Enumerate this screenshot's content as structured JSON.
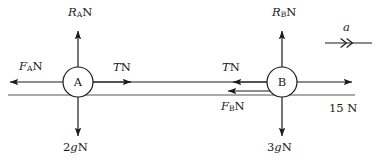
{
  "diagram": {
    "type": "free-body-force-diagram",
    "title": "",
    "bodies": [
      {
        "id": "A",
        "label": "A",
        "cx": 78,
        "cy": 82,
        "r": 15,
        "mass_weight_label": "2gN"
      },
      {
        "id": "B",
        "label": "B",
        "cx": 282,
        "cy": 82,
        "r": 15,
        "mass_weight_label": "3gN"
      }
    ],
    "ground_line": {
      "y": 95,
      "x1": 8,
      "x2": 355
    },
    "forces": [
      {
        "name": "normal-reaction-a",
        "label_text": "R",
        "label_sub": "A",
        "label_unit": "N",
        "direction": "up",
        "body": "A"
      },
      {
        "name": "normal-reaction-b",
        "label_text": "R",
        "label_sub": "B",
        "label_unit": "N",
        "direction": "up",
        "body": "B"
      },
      {
        "name": "friction-a",
        "label_text": "F",
        "label_sub": "A",
        "label_unit": "N",
        "direction": "left",
        "body": "A"
      },
      {
        "name": "friction-b",
        "label_text": "F",
        "label_sub": "B",
        "label_unit": "N",
        "direction": "left",
        "body": "B"
      },
      {
        "name": "tension-a",
        "label_text": "T",
        "label_sub": "",
        "label_unit": "N",
        "direction": "right",
        "body": "A"
      },
      {
        "name": "tension-b",
        "label_text": "T",
        "label_sub": "",
        "label_unit": "N",
        "direction": "left",
        "body": "B"
      },
      {
        "name": "weight-a",
        "label_text": "2gN",
        "direction": "down",
        "body": "A"
      },
      {
        "name": "weight-b",
        "label_text": "3gN",
        "direction": "down",
        "body": "B"
      },
      {
        "name": "applied-force",
        "label_text": "15 N",
        "direction": "right",
        "body": "B"
      }
    ],
    "acceleration": {
      "label": "a",
      "direction": "right",
      "arrowhead": "double-chevron"
    },
    "labels": {
      "reaction_a": {
        "sym": "R",
        "sub": "A",
        "unit": "N"
      },
      "reaction_b": {
        "sym": "R",
        "sub": "B",
        "unit": "N"
      },
      "friction_a": {
        "sym": "F",
        "sub": "A",
        "unit": "N"
      },
      "friction_b": {
        "sym": "F",
        "sub": "B",
        "unit": "N"
      },
      "tension_left": {
        "sym": "T",
        "unit": "N"
      },
      "tension_right": {
        "sym": "T",
        "unit": "N"
      },
      "weight_a": "2gN",
      "weight_a_num": "2",
      "weight_a_g": "g",
      "weight_a_unit": "N",
      "weight_b_num": "3",
      "weight_b_g": "g",
      "weight_b_unit": "N",
      "applied": "15 N",
      "accel": "a",
      "node_a": "A",
      "node_b": "B"
    },
    "colors": {
      "stroke": "#1a1a1a",
      "ground": "#555555",
      "background": "#ffffff",
      "text": "#1a1a1a"
    }
  }
}
